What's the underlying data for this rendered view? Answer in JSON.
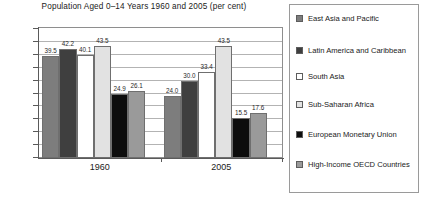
{
  "chart_data": {
    "type": "bar",
    "title": "Population Aged 0–14 Years 1960 and 2005 (per cent)",
    "xlabel": "",
    "ylabel": "",
    "ylim": [
      0.0,
      50.0
    ],
    "ytick_step": 5.0,
    "grid": true,
    "legend_position": "right",
    "categories": [
      "1960",
      "2005"
    ],
    "ytick_labels": [
      "50.0",
      "45.0",
      "40.0",
      "35.0",
      "30.0",
      "25.0",
      "20.0",
      "15.0",
      "10.0",
      "5.0",
      "0.0"
    ],
    "series": [
      {
        "name": "East Asia and Pacific",
        "values": [
          39.5,
          24.0
        ],
        "color": "#7d7d7d"
      },
      {
        "name": "Latin America and Caribbean",
        "values": [
          42.2,
          30.0
        ],
        "color": "#3f3f3f"
      },
      {
        "name": "South Asia",
        "values": [
          40.1,
          33.4
        ],
        "color": "#ffffff"
      },
      {
        "name": "Sub-Saharan Africa",
        "values": [
          43.5,
          43.5
        ],
        "color": "#e2e2e2"
      },
      {
        "name": "European Monetary Union",
        "values": [
          24.9,
          15.5
        ],
        "color": "#0d0d0d"
      },
      {
        "name": "High-Income OECD Countries",
        "values": [
          26.1,
          17.6
        ],
        "color": "#9a9a9a"
      }
    ]
  },
  "legend": {
    "items": [
      {
        "label": "East Asia and Pacific",
        "color": "#7d7d7d"
      },
      {
        "label": "Latin America and Caribbean",
        "color": "#3f3f3f"
      },
      {
        "label": "South Asia",
        "color": "#ffffff"
      },
      {
        "label": "Sub-Saharan Africa",
        "color": "#e2e2e2"
      },
      {
        "label": "European Monetary Union",
        "color": "#0d0d0d"
      },
      {
        "label": "High-Income OECD Countries",
        "color": "#9a9a9a"
      }
    ]
  }
}
